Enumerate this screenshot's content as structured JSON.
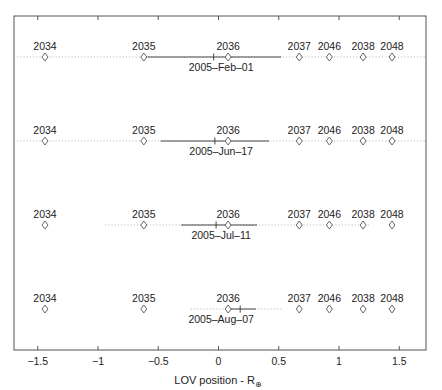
{
  "chart_data": {
    "type": "scatter",
    "title": "",
    "xlabel": "LOV position - R",
    "xlabel_subscript": "⊕",
    "ylabel": "",
    "xlim": [
      -1.7,
      1.73
    ],
    "grid": false,
    "x_ticks": [
      -1.5,
      -1,
      -0.5,
      0,
      0.5,
      1,
      1.5
    ],
    "x_tick_labels": [
      "-1.5",
      "-1",
      "-0.5",
      "0",
      "0.5",
      "1",
      "1.5"
    ],
    "markers": [
      {
        "label": "2034",
        "x": -1.44
      },
      {
        "label": "2035",
        "x": -0.62
      },
      {
        "label": "2036",
        "x": 0.08
      },
      {
        "label": "2037",
        "x": 0.67
      },
      {
        "label": "2046",
        "x": 0.92
      },
      {
        "label": "2038",
        "x": 1.2
      },
      {
        "label": "2048",
        "x": 1.44
      }
    ],
    "rows": [
      {
        "date": "2005-Feb-01",
        "solid": [
          -0.59,
          0.52
        ],
        "dotted": [
          -1.7,
          1.73
        ],
        "nominal": -0.04
      },
      {
        "date": "2005-Jun-17",
        "solid": [
          -0.48,
          0.42
        ],
        "dotted": [
          -1.7,
          1.73
        ],
        "nominal": -0.03
      },
      {
        "date": "2005-Jul-11",
        "solid": [
          -0.31,
          0.32
        ],
        "dotted": [
          -0.94,
          1.26
        ],
        "nominal": -0.02
      },
      {
        "date": "2005-Aug-07",
        "solid": [
          0.1,
          0.31
        ],
        "dotted": [
          -0.23,
          0.54
        ],
        "nominal": 0.18
      }
    ]
  },
  "colors": {
    "frame": "#555555",
    "line": "#333333",
    "dotted": "#bbbbbb",
    "marker": "#555555",
    "text": "#222222"
  }
}
